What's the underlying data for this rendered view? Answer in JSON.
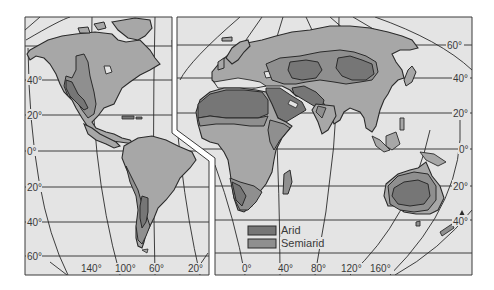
{
  "map": {
    "title": "Arid and semiarid regions of the world",
    "projection": "interrupted world map, two panels (Americas | Eurasia-Africa-Australia)",
    "colors": {
      "ocean": "#e4e4e4",
      "land": "#a7a7a7",
      "semiarid": "#8f8f8f",
      "arid": "#767676",
      "outline": "#2a2a2a",
      "gap": "#ffffff"
    },
    "latitude_labels_left": [
      "40°",
      "20°",
      "0°",
      "20°",
      "40°",
      "60°"
    ],
    "latitude_labels_right": [
      "60°",
      "40°",
      "20°",
      "0°",
      "20°",
      "40°"
    ],
    "longitude_labels_left": [
      "140°",
      "100°",
      "60°",
      "20°"
    ],
    "longitude_labels_right": [
      "0°",
      "40°",
      "80°",
      "120°",
      "160°"
    ]
  },
  "legend": {
    "items": [
      {
        "label": "Arid",
        "color": "#767676"
      },
      {
        "label": "Semiarid",
        "color": "#8f8f8f"
      }
    ]
  }
}
